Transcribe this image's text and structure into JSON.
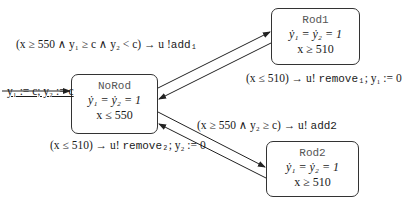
{
  "states": {
    "norod": {
      "name": "NoRod",
      "flow": "ẏ₁ = ẏ₂ = 1",
      "invariant": "x ≤ 550"
    },
    "rod1": {
      "name": "Rod1",
      "flow": "ẏ₁ = ẏ₂ = 1",
      "invariant": "x ≥ 510"
    },
    "rod2": {
      "name": "Rod2",
      "flow": "ẏ₁ = ẏ₂ = 1",
      "invariant": "x ≥ 510"
    }
  },
  "transitions": {
    "initial": {
      "label": "y₁ := c; y₂ := c"
    },
    "norod_to_rod1": {
      "guard": "(x ≥ 550 ∧ y₁ ≥ c ∧ y₂ < c) → u !",
      "action": "add₁"
    },
    "rod1_to_norod": {
      "guard": "(x ≤ 510) → u! ",
      "action": "remove₁",
      "reset": "; y₁ := 0"
    },
    "norod_to_rod2": {
      "guard": "(x ≥ 550 ∧ y₂ ≥ c) → u! ",
      "action": "add2"
    },
    "rod2_to_norod": {
      "guard": "(x ≤ 510) → u! ",
      "action": "remove₂",
      "reset": "; y₂ := 0"
    }
  }
}
